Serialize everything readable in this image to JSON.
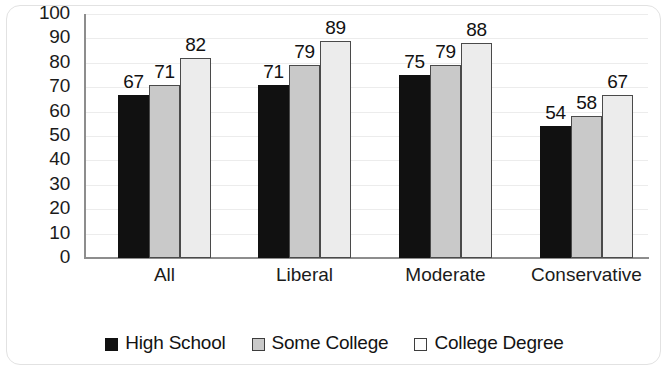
{
  "chart_data": {
    "type": "bar",
    "title": "",
    "subtitle": "",
    "xlabel": "",
    "ylabel": "",
    "ylim": [
      0,
      100
    ],
    "ytick_step": 10,
    "yticks": [
      "100",
      "90",
      "80",
      "70",
      "60",
      "50",
      "40",
      "30",
      "20",
      "10",
      "0"
    ],
    "grid": true,
    "grid_axis": "y",
    "legend_position": "bottom-center",
    "categories": [
      "All",
      "Liberal",
      "Moderate",
      "Conservative"
    ],
    "series": [
      {
        "name": "High School",
        "color": "#111111",
        "swatch": "legend-swatch-high-school",
        "values": [
          67,
          71,
          75,
          54
        ]
      },
      {
        "name": "Some College",
        "color": "#c9c9c9",
        "swatch": "legend-swatch-some-college",
        "values": [
          71,
          79,
          79,
          58
        ]
      },
      {
        "name": "College Degree",
        "color": "#ececec",
        "swatch": "legend-swatch-college-degree",
        "values": [
          82,
          89,
          88,
          67
        ]
      }
    ],
    "data_labels": [
      [
        "67",
        "71",
        "82"
      ],
      [
        "71",
        "79",
        "89"
      ],
      [
        "75",
        "79",
        "88"
      ],
      [
        "54",
        "58",
        "67"
      ]
    ]
  }
}
